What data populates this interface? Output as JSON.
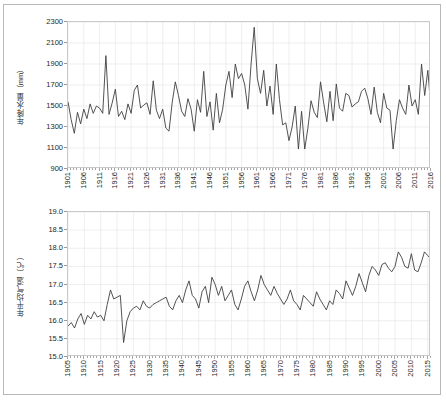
{
  "figure": {
    "background_color": "#ffffff",
    "border_color": "#b8b8b8",
    "line_color": "#404040",
    "grid_color": "#e6e6e6",
    "axis_color": "#c9c9c9"
  },
  "chart_data": [
    {
      "type": "line",
      "id": "annual-precipitation",
      "title": "",
      "xlabel": "",
      "ylabel": "年降水量（mm）",
      "ylim": [
        900,
        2300
      ],
      "yticks": [
        900,
        1100,
        1300,
        1500,
        1700,
        1900,
        2100,
        2300
      ],
      "ytick_labels": [
        "900",
        "1100",
        "1300",
        "1500",
        "1700",
        "1900",
        "2100",
        "2300"
      ],
      "xlim": [
        1901,
        2016
      ],
      "xticks": [
        1901,
        1906,
        1911,
        1916,
        1921,
        1926,
        1931,
        1936,
        1941,
        1946,
        1951,
        1956,
        1961,
        1966,
        1971,
        1976,
        1981,
        1986,
        1991,
        1996,
        2001,
        2006,
        2011,
        2016
      ],
      "xtick_labels": [
        "1901",
        "1906",
        "1911",
        "1916",
        "1921",
        "1926",
        "1931",
        "1936",
        "1941",
        "1946",
        "1951",
        "1956",
        "1961",
        "1966",
        "1971",
        "1976",
        "1981",
        "1986",
        "1991",
        "1996",
        "2001",
        "2006",
        "2011",
        "2016"
      ],
      "grid": true,
      "legend": "none",
      "x": [
        1901,
        1902,
        1903,
        1904,
        1905,
        1906,
        1907,
        1908,
        1909,
        1910,
        1911,
        1912,
        1913,
        1914,
        1915,
        1916,
        1917,
        1918,
        1919,
        1920,
        1921,
        1922,
        1923,
        1924,
        1925,
        1926,
        1927,
        1928,
        1929,
        1930,
        1931,
        1932,
        1933,
        1934,
        1935,
        1936,
        1937,
        1938,
        1939,
        1940,
        1941,
        1942,
        1943,
        1944,
        1945,
        1946,
        1947,
        1948,
        1949,
        1950,
        1951,
        1952,
        1953,
        1954,
        1955,
        1956,
        1957,
        1958,
        1959,
        1960,
        1961,
        1962,
        1963,
        1964,
        1965,
        1966,
        1967,
        1968,
        1969,
        1970,
        1971,
        1972,
        1973,
        1974,
        1975,
        1976,
        1977,
        1978,
        1979,
        1980,
        1981,
        1982,
        1983,
        1984,
        1985,
        1986,
        1987,
        1988,
        1989,
        1990,
        1991,
        1992,
        1993,
        1994,
        1995,
        1996,
        1997,
        1998,
        1999,
        2000,
        2001,
        2002,
        2003,
        2004,
        2005,
        2006,
        2007,
        2008,
        2009,
        2010,
        2011,
        2012,
        2013,
        2014,
        2015,
        2016
      ],
      "values": [
        1540,
        1370,
        1240,
        1440,
        1330,
        1470,
        1380,
        1520,
        1430,
        1500,
        1480,
        1430,
        1980,
        1420,
        1530,
        1660,
        1400,
        1450,
        1370,
        1520,
        1430,
        1650,
        1700,
        1480,
        1510,
        1530,
        1420,
        1740,
        1460,
        1380,
        1470,
        1290,
        1260,
        1530,
        1730,
        1600,
        1450,
        1400,
        1570,
        1470,
        1260,
        1560,
        1440,
        1830,
        1400,
        1540,
        1270,
        1620,
        1340,
        1470,
        1700,
        1830,
        1580,
        1900,
        1760,
        1810,
        1700,
        1470,
        1900,
        2250,
        1760,
        1620,
        1840,
        1500,
        1690,
        1420,
        1900,
        1560,
        1320,
        1340,
        1170,
        1300,
        1500,
        1090,
        1450,
        1090,
        1290,
        1550,
        1440,
        1390,
        1730,
        1530,
        1350,
        1640,
        1360,
        1710,
        1480,
        1450,
        1620,
        1600,
        1490,
        1520,
        1540,
        1640,
        1670,
        1570,
        1420,
        1680,
        1440,
        1340,
        1620,
        1480,
        1460,
        1090,
        1360,
        1560,
        1480,
        1420,
        1700,
        1500,
        1560,
        1420,
        1900,
        1600,
        1840,
        1470
      ]
    },
    {
      "type": "line",
      "id": "annual-mean-temperature",
      "title": "",
      "xlabel": "",
      "ylabel": "年平均气温（℃）",
      "ylim": [
        15.0,
        19.0
      ],
      "yticks": [
        15.0,
        15.5,
        16.0,
        16.5,
        17.0,
        17.5,
        18.0,
        18.5,
        19.0
      ],
      "ytick_labels": [
        "15.0",
        "15.5",
        "16.0",
        "16.5",
        "17.0",
        "17.5",
        "18.0",
        "18.5",
        "19.0"
      ],
      "xlim": [
        1905,
        2016
      ],
      "xticks": [
        1905,
        1910,
        1915,
        1920,
        1925,
        1930,
        1935,
        1940,
        1945,
        1950,
        1955,
        1960,
        1965,
        1970,
        1975,
        1980,
        1985,
        1990,
        1995,
        2000,
        2005,
        2010,
        2015
      ],
      "xtick_labels": [
        "1905",
        "1910",
        "1915",
        "1920",
        "1925",
        "1930",
        "1935",
        "1940",
        "1945",
        "1950",
        "1955",
        "1960",
        "1965",
        "1970",
        "1975",
        "1980",
        "1985",
        "1990",
        "1995",
        "2000",
        "2005",
        "2010",
        "2015"
      ],
      "grid": true,
      "legend": "none",
      "x": [
        1905,
        1906,
        1907,
        1908,
        1909,
        1910,
        1911,
        1912,
        1913,
        1914,
        1915,
        1916,
        1917,
        1918,
        1919,
        1920,
        1921,
        1922,
        1923,
        1924,
        1925,
        1926,
        1927,
        1928,
        1929,
        1930,
        1931,
        1932,
        1933,
        1934,
        1935,
        1936,
        1937,
        1938,
        1939,
        1940,
        1941,
        1942,
        1943,
        1944,
        1945,
        1946,
        1947,
        1948,
        1949,
        1950,
        1951,
        1952,
        1953,
        1954,
        1955,
        1956,
        1957,
        1958,
        1959,
        1960,
        1961,
        1962,
        1963,
        1964,
        1965,
        1966,
        1967,
        1968,
        1969,
        1970,
        1971,
        1972,
        1973,
        1974,
        1975,
        1976,
        1977,
        1978,
        1979,
        1980,
        1981,
        1982,
        1983,
        1984,
        1985,
        1986,
        1987,
        1988,
        1989,
        1990,
        1991,
        1992,
        1993,
        1994,
        1995,
        1996,
        1997,
        1998,
        1999,
        2000,
        2001,
        2002,
        2003,
        2004,
        2005,
        2006,
        2007,
        2008,
        2009,
        2010,
        2011,
        2012,
        2013,
        2014,
        2015,
        2016
      ],
      "values": [
        15.85,
        15.95,
        15.8,
        16.05,
        16.2,
        15.9,
        16.15,
        16.05,
        16.25,
        16.1,
        16.15,
        16.0,
        16.45,
        16.85,
        16.6,
        16.65,
        16.7,
        15.4,
        16.0,
        16.25,
        16.35,
        16.4,
        16.3,
        16.55,
        16.4,
        16.35,
        16.45,
        16.5,
        16.55,
        16.6,
        16.65,
        16.4,
        16.3,
        16.55,
        16.7,
        16.5,
        16.85,
        17.1,
        16.7,
        16.6,
        16.35,
        16.8,
        16.95,
        16.5,
        17.2,
        17.0,
        16.7,
        16.95,
        16.55,
        16.7,
        16.85,
        16.45,
        16.3,
        16.6,
        16.95,
        17.1,
        16.8,
        16.55,
        16.85,
        17.25,
        17.0,
        16.85,
        16.7,
        16.95,
        16.75,
        16.6,
        16.45,
        16.6,
        16.85,
        16.55,
        16.45,
        16.3,
        16.7,
        16.6,
        16.5,
        16.4,
        16.8,
        16.6,
        16.45,
        16.3,
        16.55,
        16.45,
        16.85,
        16.75,
        16.6,
        17.1,
        16.9,
        16.7,
        16.95,
        17.3,
        17.05,
        16.8,
        17.25,
        17.5,
        17.4,
        17.25,
        17.55,
        17.6,
        17.45,
        17.35,
        17.5,
        17.9,
        17.75,
        17.5,
        17.45,
        17.85,
        17.4,
        17.35,
        17.6,
        17.9,
        17.8,
        17.7,
        17.95,
        18.1,
        17.9,
        18.35
      ]
    }
  ]
}
